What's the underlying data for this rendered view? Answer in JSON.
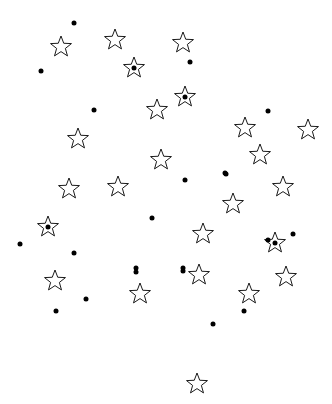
{
  "figure": {
    "title": "",
    "background_color": "#ffffff",
    "width": 332,
    "height": 404
  },
  "chart_data": {
    "type": "scatter",
    "title": "",
    "xlabel": "",
    "ylabel": "",
    "xlim": [
      0,
      332
    ],
    "ylim": [
      0,
      404
    ],
    "grid": false,
    "axes_visible": false,
    "tick_labels": {
      "x": [],
      "y": []
    },
    "legend": {
      "visible": false,
      "position": "none",
      "entries": []
    },
    "annotations": [],
    "coordinate_system": "pixel, origin top-left",
    "series": [
      {
        "name": "filled-dot",
        "marker": "circle",
        "marker_style": "filled",
        "color": "#000000",
        "marker_size": 5,
        "count": 25,
        "points": [
          {
            "x": 74,
            "y": 23
          },
          {
            "x": 41,
            "y": 71
          },
          {
            "x": 190,
            "y": 62
          },
          {
            "x": 134,
            "y": 68
          },
          {
            "x": 94,
            "y": 110
          },
          {
            "x": 185,
            "y": 97
          },
          {
            "x": 268,
            "y": 111
          },
          {
            "x": 226,
            "y": 174
          },
          {
            "x": 185,
            "y": 180
          },
          {
            "x": 225,
            "y": 173
          },
          {
            "x": 152,
            "y": 218
          },
          {
            "x": 48,
            "y": 227
          },
          {
            "x": 20,
            "y": 244
          },
          {
            "x": 74,
            "y": 253
          },
          {
            "x": 275,
            "y": 243
          },
          {
            "x": 136,
            "y": 268
          },
          {
            "x": 183,
            "y": 268
          },
          {
            "x": 86,
            "y": 299
          },
          {
            "x": 56,
            "y": 311
          },
          {
            "x": 244,
            "y": 311
          },
          {
            "x": 213,
            "y": 324
          },
          {
            "x": 293,
            "y": 234
          },
          {
            "x": 183,
            "y": 271
          },
          {
            "x": 136,
            "y": 272
          },
          {
            "x": 268,
            "y": 240
          }
        ]
      },
      {
        "name": "open-star",
        "marker": "star",
        "marker_style": "outlined",
        "color": "#000000",
        "fill": "none",
        "marker_size": 11,
        "count": 24,
        "points": [
          {
            "x": 61,
            "y": 47
          },
          {
            "x": 115,
            "y": 40
          },
          {
            "x": 183,
            "y": 43
          },
          {
            "x": 134,
            "y": 68
          },
          {
            "x": 185,
            "y": 97
          },
          {
            "x": 157,
            "y": 110
          },
          {
            "x": 78,
            "y": 139
          },
          {
            "x": 245,
            "y": 128
          },
          {
            "x": 308,
            "y": 130
          },
          {
            "x": 161,
            "y": 160
          },
          {
            "x": 260,
            "y": 155
          },
          {
            "x": 69,
            "y": 189
          },
          {
            "x": 118,
            "y": 187
          },
          {
            "x": 283,
            "y": 187
          },
          {
            "x": 233,
            "y": 204
          },
          {
            "x": 48,
            "y": 227
          },
          {
            "x": 203,
            "y": 234
          },
          {
            "x": 275,
            "y": 243
          },
          {
            "x": 199,
            "y": 275
          },
          {
            "x": 286,
            "y": 277
          },
          {
            "x": 140,
            "y": 294
          },
          {
            "x": 249,
            "y": 294
          },
          {
            "x": 55,
            "y": 281
          },
          {
            "x": 197,
            "y": 384
          }
        ]
      }
    ]
  }
}
